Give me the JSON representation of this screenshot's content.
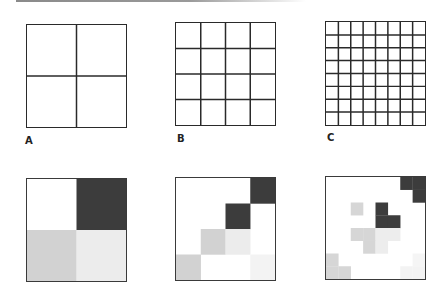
{
  "figure": {
    "panels_top": [
      {
        "label": "A",
        "divisions": 2
      },
      {
        "label": "B",
        "divisions": 4
      },
      {
        "label": "C",
        "divisions": 8
      }
    ],
    "panels_bottom": [
      {
        "divisions": 2,
        "cells": [
          {
            "row": 0,
            "col": 1,
            "color": "#3c3c3c"
          },
          {
            "row": 1,
            "col": 0,
            "color": "#d2d2d2"
          },
          {
            "row": 1,
            "col": 1,
            "color": "#ececec"
          }
        ]
      },
      {
        "divisions": 4,
        "cells": [
          {
            "row": 0,
            "col": 3,
            "color": "#3c3c3c"
          },
          {
            "row": 1,
            "col": 2,
            "color": "#3c3c3c"
          },
          {
            "row": 2,
            "col": 1,
            "color": "#d2d2d2"
          },
          {
            "row": 2,
            "col": 2,
            "color": "#ececec"
          },
          {
            "row": 3,
            "col": 0,
            "color": "#d2d2d2"
          },
          {
            "row": 3,
            "col": 3,
            "color": "#f3f3f3"
          }
        ]
      },
      {
        "divisions": 8,
        "cells": [
          {
            "row": 0,
            "col": 6,
            "color": "#3c3c3c"
          },
          {
            "row": 0,
            "col": 7,
            "color": "#3c3c3c"
          },
          {
            "row": 1,
            "col": 7,
            "color": "#3c3c3c"
          },
          {
            "row": 2,
            "col": 2,
            "color": "#d6d6d6"
          },
          {
            "row": 2,
            "col": 4,
            "color": "#3c3c3c"
          },
          {
            "row": 3,
            "col": 4,
            "color": "#3c3c3c"
          },
          {
            "row": 3,
            "col": 5,
            "color": "#3c3c3c"
          },
          {
            "row": 4,
            "col": 2,
            "color": "#d6d6d6"
          },
          {
            "row": 4,
            "col": 3,
            "color": "#d6d6d6"
          },
          {
            "row": 4,
            "col": 4,
            "color": "#ededed"
          },
          {
            "row": 4,
            "col": 5,
            "color": "#ededed"
          },
          {
            "row": 5,
            "col": 3,
            "color": "#d6d6d6"
          },
          {
            "row": 5,
            "col": 4,
            "color": "#ededed"
          },
          {
            "row": 6,
            "col": 0,
            "color": "#d6d6d6"
          },
          {
            "row": 7,
            "col": 0,
            "color": "#d6d6d6"
          },
          {
            "row": 7,
            "col": 1,
            "color": "#d6d6d6"
          },
          {
            "row": 6,
            "col": 7,
            "color": "#f5f5f5"
          },
          {
            "row": 7,
            "col": 6,
            "color": "#f3f3f3"
          },
          {
            "row": 7,
            "col": 7,
            "color": "#f3f3f3"
          }
        ]
      }
    ],
    "colors": {
      "grid_line": "#2a2a2a",
      "dark_fill": "#3c3c3c",
      "mid_fill": "#d2d2d2",
      "light_fill": "#ececec"
    }
  }
}
